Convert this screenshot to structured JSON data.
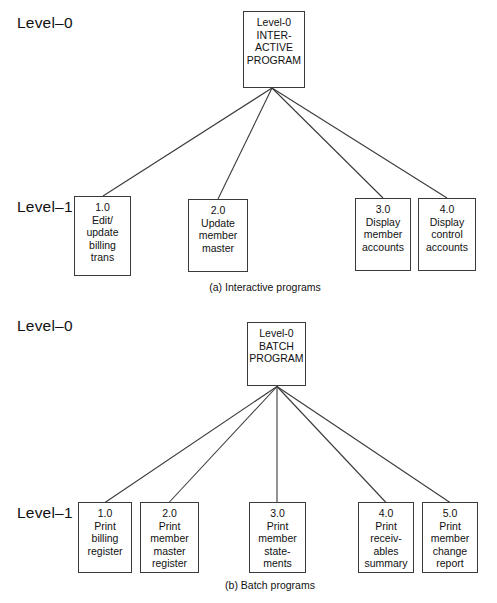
{
  "figure": {
    "diagrams": [
      {
        "id": "interactive",
        "caption": "(a) Interactive programs",
        "level0_label": "Level–0",
        "level1_label": "Level–1",
        "root": {
          "lines": [
            "Level-0",
            "INTER-",
            "ACTIVE",
            "PROGRAM"
          ],
          "box": {
            "x": 243,
            "y": 11,
            "w": 62,
            "h": 77
          }
        },
        "children": [
          {
            "lines": [
              "1.0",
              "Edit/",
              "update",
              "billing",
              "trans"
            ],
            "box": {
              "x": 74,
              "y": 196,
              "w": 57,
              "h": 80
            },
            "anchor_x": 103
          },
          {
            "lines": [
              "2.0",
              "Update",
              "member",
              "master"
            ],
            "box": {
              "x": 188,
              "y": 199,
              "w": 60,
              "h": 73
            },
            "anchor_x": 218
          },
          {
            "lines": [
              "3.0",
              "Display",
              "member",
              "accounts"
            ],
            "box": {
              "x": 355,
              "y": 198,
              "w": 56,
              "h": 73
            },
            "anchor_x": 383
          },
          {
            "lines": [
              "4.0",
              "Display",
              "control",
              "accounts"
            ],
            "box": {
              "x": 418,
              "y": 198,
              "w": 58,
              "h": 73
            },
            "anchor_x": 447
          }
        ],
        "fan_origin": {
          "x": 272,
          "y": 88
        },
        "level0_label_pos": {
          "x": 17,
          "y": 14
        },
        "level1_label_pos": {
          "x": 17,
          "y": 198
        },
        "caption_pos": {
          "x": 265,
          "y": 281
        }
      },
      {
        "id": "batch",
        "caption": "(b) Batch programs",
        "level0_label": "Level–0",
        "level1_label": "Level–1",
        "root": {
          "lines": [
            "Level-0",
            "BATCH",
            "PROGRAM"
          ],
          "box": {
            "x": 247,
            "y": 20,
            "w": 59,
            "h": 64
          }
        },
        "children": [
          {
            "lines": [
              "1.0",
              "Print",
              "billing",
              "register"
            ],
            "box": {
              "x": 78,
              "y": 200,
              "w": 54,
              "h": 71
            },
            "anchor_x": 105
          },
          {
            "lines": [
              "2.0",
              "Print",
              "member",
              "master",
              "register"
            ],
            "box": {
              "x": 140,
              "y": 200,
              "w": 59,
              "h": 71
            },
            "anchor_x": 169
          },
          {
            "lines": [
              "3.0",
              "Print",
              "member",
              "state-",
              "ments"
            ],
            "box": {
              "x": 249,
              "y": 200,
              "w": 57,
              "h": 71
            },
            "anchor_x": 277
          },
          {
            "lines": [
              "4.0",
              "Print",
              "receiv-",
              "ables",
              "summary"
            ],
            "box": {
              "x": 358,
              "y": 200,
              "w": 56,
              "h": 71
            },
            "anchor_x": 386
          },
          {
            "lines": [
              "5.0",
              "Print",
              "member",
              "change",
              "report"
            ],
            "box": {
              "x": 422,
              "y": 200,
              "w": 56,
              "h": 71
            },
            "anchor_x": 450
          }
        ],
        "fan_origin": {
          "x": 277,
          "y": 84
        },
        "level0_label_pos": {
          "x": 17,
          "y": 15
        },
        "level1_label_pos": {
          "x": 17,
          "y": 202
        },
        "caption_pos": {
          "x": 270,
          "y": 277
        }
      }
    ],
    "style": {
      "line_color": "#3a3a3a",
      "background": "#ffffff",
      "text_color": "#111111"
    }
  }
}
